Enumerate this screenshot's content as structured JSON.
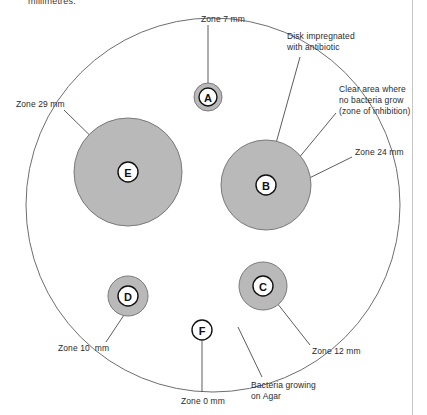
{
  "page": {
    "title_clipped": "millimetres.",
    "background_color": "#ffffff",
    "border_color": "#c9c9c9"
  },
  "colors": {
    "zone_fill": "#b9b9b9",
    "zone_stroke": "#7a7a7a",
    "dish_stroke": "#6e6e6e",
    "disk_fill": "#ffffff",
    "disk_stroke": "#111111",
    "leader_stroke": "#4a4a4a",
    "text": "#2b2b2b"
  },
  "dish": {
    "name": "petri-dish",
    "cx": 213,
    "cy": 205,
    "r": 187
  },
  "disks": [
    {
      "id": "A",
      "letter": "A",
      "cx": 208,
      "cy": 97,
      "zone_r": 14,
      "disk_r": 9,
      "zone_label": "Zone 7 mm"
    },
    {
      "id": "E",
      "letter": "E",
      "cx": 128,
      "cy": 172,
      "zone_r": 54,
      "disk_r": 10,
      "zone_label": "Zone 29 mm"
    },
    {
      "id": "B",
      "letter": "B",
      "cx": 266,
      "cy": 185,
      "zone_r": 45,
      "disk_r": 10,
      "zone_label": "Zone 24 mm"
    },
    {
      "id": "D",
      "letter": "D",
      "cx": 128,
      "cy": 296,
      "zone_r": 20,
      "disk_r": 10,
      "zone_label": "Zone 10 mm"
    },
    {
      "id": "C",
      "letter": "C",
      "cx": 263,
      "cy": 286,
      "zone_r": 24,
      "disk_r": 10,
      "zone_label": "Zone 12 mm"
    },
    {
      "id": "F",
      "letter": "F",
      "cx": 202,
      "cy": 330,
      "zone_r": 0,
      "disk_r": 10,
      "zone_label": "Zone 0 mm"
    }
  ],
  "annotations": [
    {
      "name": "zone-7mm-label",
      "lines": [
        "Zone 7 mm"
      ],
      "x": 201,
      "y": 14,
      "align": "left",
      "leader": [
        [
          208,
          25
        ],
        [
          208,
          83
        ]
      ]
    },
    {
      "name": "disk-impregnated-label",
      "lines": [
        "Disk impregnated",
        "with antibiotic"
      ],
      "x": 287,
      "y": 31,
      "align": "left",
      "leader": [
        [
          300,
          57
        ],
        [
          268,
          172
        ]
      ]
    },
    {
      "name": "clear-area-label",
      "lines": [
        "Clear area where",
        "no bacteria grow",
        "(zone of inhibition)"
      ],
      "x": 339,
      "y": 84,
      "align": "left",
      "leader": [
        [
          336,
          113
        ],
        [
          293,
          165
        ]
      ]
    },
    {
      "name": "zone-24mm-label",
      "lines": [
        "Zone 24 mm"
      ],
      "x": 355,
      "y": 147,
      "align": "left",
      "leader": [
        [
          352,
          157
        ],
        [
          285,
          190
        ]
      ]
    },
    {
      "name": "zone-29mm-label",
      "lines": [
        "Zone 29 mm"
      ],
      "x": 16,
      "y": 99,
      "align": "left",
      "leader": [
        [
          64,
          110
        ],
        [
          110,
          155
        ]
      ]
    },
    {
      "name": "zone-10mm-label",
      "lines": [
        "Zone 10  mm"
      ],
      "x": 58,
      "y": 343,
      "align": "left",
      "leader": [
        [
          106,
          342
        ],
        [
          124,
          315
        ]
      ]
    },
    {
      "name": "zone-0mm-label",
      "lines": [
        "Zone 0 mm"
      ],
      "x": 181,
      "y": 396,
      "align": "left",
      "leader": [
        [
          202,
          392
        ],
        [
          202,
          341
        ]
      ]
    },
    {
      "name": "zone-12mm-label",
      "lines": [
        "Zone 12 mm"
      ],
      "x": 312,
      "y": 346,
      "align": "left",
      "leader": [
        [
          310,
          345
        ],
        [
          277,
          303
        ]
      ]
    },
    {
      "name": "bacteria-growing-label",
      "lines": [
        "Bacteria growing",
        "on Agar"
      ],
      "x": 251,
      "y": 380,
      "align": "left",
      "leader": [
        [
          262,
          377
        ],
        [
          238,
          327
        ]
      ]
    }
  ]
}
